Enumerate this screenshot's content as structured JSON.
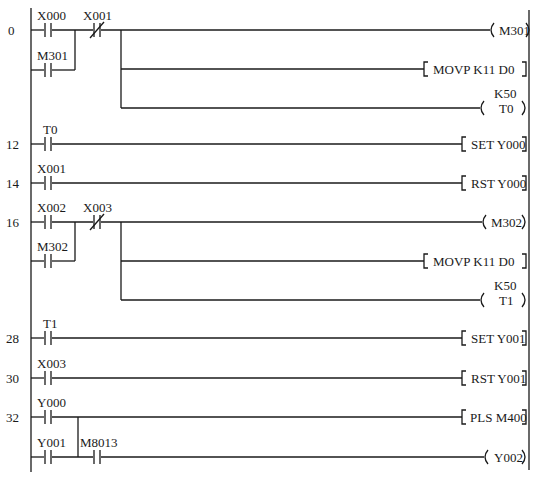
{
  "diagram": {
    "type": "PLC ladder diagram",
    "left_rail_x": 31,
    "right_rail_x": 529,
    "line_color": "#1a1a1a",
    "steps": [
      {
        "label": "0",
        "y": 30
      },
      {
        "label": "12",
        "y": 144
      },
      {
        "label": "14",
        "y": 183
      },
      {
        "label": "16",
        "y": 222
      },
      {
        "label": "28",
        "y": 338
      },
      {
        "label": "30",
        "y": 378
      },
      {
        "label": "32",
        "y": 417
      }
    ],
    "rungs": [
      {
        "step": "0",
        "contacts": [
          {
            "name": "X000",
            "type": "NO",
            "x": 47,
            "y": 30
          },
          {
            "name": "M301",
            "type": "NO",
            "x": 47,
            "y": 70,
            "parallel_with": "X000"
          },
          {
            "name": "X001",
            "type": "NC",
            "x": 93,
            "y": 30
          }
        ],
        "outputs": [
          {
            "kind": "coil",
            "text": "M301",
            "y": 30
          },
          {
            "kind": "instruction",
            "text": "MOVP  K11  D0",
            "y": 69
          },
          {
            "kind": "timer",
            "text": "T0",
            "preset": "K50",
            "y": 108
          }
        ]
      },
      {
        "step": "12",
        "contacts": [
          {
            "name": "T0",
            "type": "NO",
            "x": 47,
            "y": 144
          }
        ],
        "outputs": [
          {
            "kind": "instruction",
            "text": "SET  Y000",
            "y": 144
          }
        ]
      },
      {
        "step": "14",
        "contacts": [
          {
            "name": "X001",
            "type": "NO",
            "x": 47,
            "y": 183
          }
        ],
        "outputs": [
          {
            "kind": "instruction",
            "text": "RST  Y000",
            "y": 183
          }
        ]
      },
      {
        "step": "16",
        "contacts": [
          {
            "name": "X002",
            "type": "NO",
            "x": 47,
            "y": 222
          },
          {
            "name": "M302",
            "type": "NO",
            "x": 47,
            "y": 261,
            "parallel_with": "X002"
          },
          {
            "name": "X003",
            "type": "NC",
            "x": 93,
            "y": 222
          }
        ],
        "outputs": [
          {
            "kind": "coil",
            "text": "M302",
            "y": 222
          },
          {
            "kind": "instruction",
            "text": "MOVP  K11  D0",
            "y": 261
          },
          {
            "kind": "timer",
            "text": "T1",
            "preset": "K50",
            "y": 300
          }
        ]
      },
      {
        "step": "28",
        "contacts": [
          {
            "name": "T1",
            "type": "NO",
            "x": 47,
            "y": 338
          }
        ],
        "outputs": [
          {
            "kind": "instruction",
            "text": "SET  Y001",
            "y": 338
          }
        ]
      },
      {
        "step": "30",
        "contacts": [
          {
            "name": "X003",
            "type": "NO",
            "x": 47,
            "y": 378
          }
        ],
        "outputs": [
          {
            "kind": "instruction",
            "text": "RST  Y001",
            "y": 378
          }
        ]
      },
      {
        "step": "32",
        "contacts": [
          {
            "name": "Y000",
            "type": "NO",
            "x": 47,
            "y": 417
          },
          {
            "name": "Y001",
            "type": "NO",
            "x": 47,
            "y": 457
          },
          {
            "name": "M8013",
            "type": "NO",
            "x": 93,
            "y": 457
          }
        ],
        "outputs": [
          {
            "kind": "instruction",
            "text": "PLS  M400",
            "y": 417
          },
          {
            "kind": "coil",
            "text": "Y002",
            "y": 457
          }
        ]
      }
    ]
  },
  "labels": {
    "step_0": "0",
    "step_12": "12",
    "step_14": "14",
    "step_16": "16",
    "step_28": "28",
    "step_30": "30",
    "step_32": "32",
    "c_x000": "X000",
    "c_x001_nc": "X001",
    "c_m301": "M301",
    "c_t0": "T0",
    "c_x001": "X001",
    "c_x002": "X002",
    "c_x003_nc": "X003",
    "c_m302": "M302",
    "c_t1": "T1",
    "c_x003": "X003",
    "c_y000": "Y000",
    "c_y001": "Y001",
    "c_m8013": "M8013",
    "o_m301": "M301",
    "o_movp1": "MOVP  K11  D0",
    "o_k50_1": "K50",
    "o_t0": "T0",
    "o_set_y000": "SET  Y000",
    "o_rst_y000": "RST  Y000",
    "o_m302": "M302",
    "o_movp2": "MOVP  K11  D0",
    "o_k50_2": "K50",
    "o_t1": "T1",
    "o_set_y001": "SET  Y001",
    "o_rst_y001": "RST  Y001",
    "o_pls_m400": "PLS  M400",
    "o_y002": "Y002"
  }
}
